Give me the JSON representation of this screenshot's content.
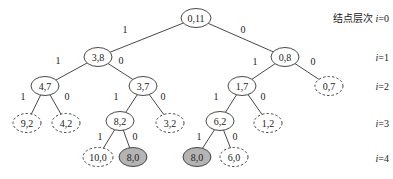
{
  "levels": [
    {
      "prefix": "结点层次 ",
      "var": "i",
      "eq": "=0",
      "y": 18
    },
    {
      "prefix": "",
      "var": "i",
      "eq": "=1",
      "y": 57
    },
    {
      "prefix": "",
      "var": "i",
      "eq": "=2",
      "y": 86
    },
    {
      "prefix": "",
      "var": "i",
      "eq": "=3",
      "y": 123
    },
    {
      "prefix": "",
      "var": "i",
      "eq": "=4",
      "y": 158
    }
  ],
  "nodes": [
    {
      "id": "n0",
      "label": "0,11",
      "x": 196,
      "y": 18,
      "style": "solid",
      "rx": 15
    },
    {
      "id": "n1",
      "label": "3,8",
      "x": 98,
      "y": 57,
      "style": "solid",
      "rx": 14
    },
    {
      "id": "n2",
      "label": "0,8",
      "x": 285,
      "y": 57,
      "style": "solid",
      "rx": 14
    },
    {
      "id": "n3",
      "label": "4,7",
      "x": 45,
      "y": 86,
      "style": "solid",
      "rx": 14
    },
    {
      "id": "n4",
      "label": "3,7",
      "x": 143,
      "y": 86,
      "style": "solid",
      "rx": 14
    },
    {
      "id": "n5",
      "label": "1,7",
      "x": 242,
      "y": 86,
      "style": "solid",
      "rx": 14
    },
    {
      "id": "n6",
      "label": "0,7",
      "x": 329,
      "y": 86,
      "style": "dashed",
      "rx": 14
    },
    {
      "id": "n7",
      "label": "9,2",
      "x": 27,
      "y": 123,
      "style": "dashed",
      "rx": 14
    },
    {
      "id": "n8",
      "label": "4,2",
      "x": 66,
      "y": 123,
      "style": "dashed",
      "rx": 14
    },
    {
      "id": "n9",
      "label": "8,2",
      "x": 120,
      "y": 121,
      "style": "solid",
      "rx": 14
    },
    {
      "id": "n10",
      "label": "3,2",
      "x": 170,
      "y": 123,
      "style": "dashed",
      "rx": 14
    },
    {
      "id": "n11",
      "label": "6,2",
      "x": 220,
      "y": 121,
      "style": "solid",
      "rx": 14
    },
    {
      "id": "n12",
      "label": "1,2",
      "x": 268,
      "y": 123,
      "style": "dashed",
      "rx": 14
    },
    {
      "id": "n13",
      "label": "10,0",
      "x": 98,
      "y": 157,
      "style": "dashed",
      "rx": 15
    },
    {
      "id": "n14",
      "label": "8,0",
      "x": 133,
      "y": 157,
      "style": "filled",
      "rx": 14
    },
    {
      "id": "n15",
      "label": "8,0",
      "x": 197,
      "y": 157,
      "style": "filled",
      "rx": 14
    },
    {
      "id": "n16",
      "label": "6,0",
      "x": 234,
      "y": 157,
      "style": "dashed",
      "rx": 14
    }
  ],
  "edges": [
    {
      "from": "n0",
      "to": "n1",
      "label": "1",
      "lx": 125,
      "ly": 29
    },
    {
      "from": "n0",
      "to": "n2",
      "label": "0",
      "lx": 243,
      "ly": 29
    },
    {
      "from": "n1",
      "to": "n3",
      "label": "1",
      "lx": 58,
      "ly": 60
    },
    {
      "from": "n1",
      "to": "n4",
      "label": "0",
      "lx": 121,
      "ly": 60
    },
    {
      "from": "n2",
      "to": "n5",
      "label": "1",
      "lx": 255,
      "ly": 61
    },
    {
      "from": "n2",
      "to": "n6",
      "label": "0",
      "lx": 313,
      "ly": 61
    },
    {
      "from": "n3",
      "to": "n7",
      "label": "1",
      "lx": 23,
      "ly": 96
    },
    {
      "from": "n3",
      "to": "n8",
      "label": "0",
      "lx": 67,
      "ly": 96
    },
    {
      "from": "n4",
      "to": "n9",
      "label": "1",
      "lx": 116,
      "ly": 96
    },
    {
      "from": "n4",
      "to": "n10",
      "label": "0",
      "lx": 163,
      "ly": 96
    },
    {
      "from": "n5",
      "to": "n11",
      "label": "1",
      "lx": 216,
      "ly": 96
    },
    {
      "from": "n5",
      "to": "n12",
      "label": "0",
      "lx": 263,
      "ly": 96
    },
    {
      "from": "n9",
      "to": "n13",
      "label": "1",
      "lx": 100,
      "ly": 136
    },
    {
      "from": "n9",
      "to": "n14",
      "label": "0",
      "lx": 135,
      "ly": 136
    },
    {
      "from": "n11",
      "to": "n15",
      "label": "1",
      "lx": 199,
      "ly": 136
    },
    {
      "from": "n11",
      "to": "n16",
      "label": "0",
      "lx": 235,
      "ly": 136
    }
  ],
  "colors": {
    "filled_node": "#b4b4b4",
    "stroke": "#333333",
    "text": "#222222"
  }
}
